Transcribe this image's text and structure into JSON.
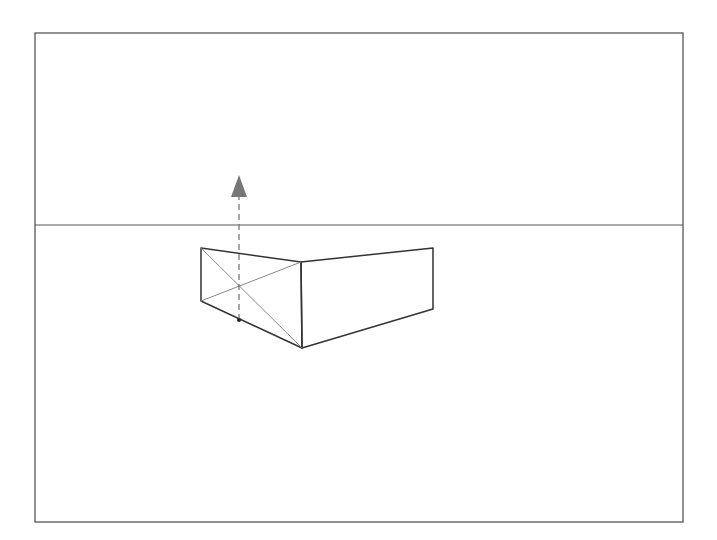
{
  "diagram": {
    "colors": {
      "background": "#ffffff",
      "frame": "#555555",
      "horizon": "#555555",
      "box_edges": "#333333",
      "diagonals": "#888888",
      "arrow": "#777777",
      "dot": "#222222"
    },
    "frame": {
      "x1": 35,
      "y1": 33,
      "x2": 683,
      "y2": 522
    },
    "horizon_line": {
      "y": 225,
      "x1": 35,
      "x2": 683
    },
    "box": {
      "left_face": {
        "top_left": [
          201,
          248
        ],
        "top_right": [
          301,
          262
        ],
        "bottom_right": [
          302,
          348
        ],
        "bottom_left": [
          201,
          301
        ]
      },
      "right_face": {
        "top_left": [
          301,
          262
        ],
        "top_right": [
          433,
          248
        ],
        "bottom_right": [
          433,
          309
        ],
        "bottom_left": [
          302,
          348
        ]
      }
    },
    "diagonals": [
      {
        "from": [
          201,
          248
        ],
        "to": [
          302,
          348
        ]
      },
      {
        "from": [
          201,
          301
        ],
        "to": [
          301,
          262
        ]
      }
    ],
    "measuring_line": {
      "x": 239,
      "y_start": 320,
      "y_end": 196,
      "style": "dashed",
      "arrow_tip": [
        239,
        175
      ],
      "arrow_base_left": [
        231,
        197
      ],
      "arrow_base_right": [
        247,
        197
      ],
      "anchor_dot": [
        239,
        320
      ]
    }
  }
}
